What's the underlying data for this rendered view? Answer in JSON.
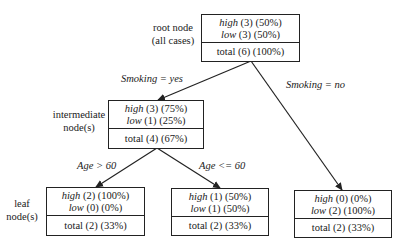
{
  "diagram": {
    "type": "decision-tree",
    "side_labels": {
      "root": [
        "root node",
        "(all cases)"
      ],
      "intermediate": [
        "intermediate",
        "node(s)"
      ],
      "leaf": [
        "leaf",
        "node(s)"
      ]
    },
    "nodes": {
      "root": {
        "high": {
          "class": "high",
          "count": "(3)",
          "pct": "(50%)"
        },
        "low": {
          "class": "low",
          "count": "(3)",
          "pct": "(50%)"
        },
        "total": "total (6) (100%)"
      },
      "intermediate": {
        "high": {
          "class": "high",
          "count": "(3)",
          "pct": "(75%)"
        },
        "low": {
          "class": "low",
          "count": "(1)",
          "pct": "(25%)"
        },
        "total": "total (4) (67%)"
      },
      "leaf_age_gt_60": {
        "high": {
          "class": "high",
          "count": "(2)",
          "pct": "(100%)"
        },
        "low": {
          "class": "low",
          "count": "(0)",
          "pct": "(0%)"
        },
        "total": "total (2) (33%)"
      },
      "leaf_age_le_60": {
        "high": {
          "class": "high",
          "count": "(1)",
          "pct": "(50%)"
        },
        "low": {
          "class": "low",
          "count": "(1)",
          "pct": "(50%)"
        },
        "total": "total (2) (33%)"
      },
      "leaf_smoking_no": {
        "high": {
          "class": "high",
          "count": "(0)",
          "pct": "(0%)"
        },
        "low": {
          "class": "low",
          "count": "(2)",
          "pct": "(100%)"
        },
        "total": "total (2) (33%)"
      }
    },
    "edges": {
      "smoking_yes": "Smoking = yes",
      "smoking_no": "Smoking = no",
      "age_gt_60": "Age > 60",
      "age_le_60": "Age <= 60"
    },
    "colors": {
      "line": "#222222",
      "text": "#1a1a1a",
      "background": "#ffffff"
    }
  }
}
